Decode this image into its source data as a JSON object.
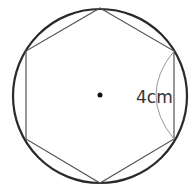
{
  "diagram": {
    "type": "regular hexagon inscribed in circle",
    "circle": {
      "cx": 100,
      "cy": 96,
      "r": 87,
      "stroke": "#2a2a2a",
      "stroke_width": 2.2
    },
    "hexagon": {
      "points": [
        [
          100,
          8
        ],
        [
          174,
          51
        ],
        [
          174,
          139
        ],
        [
          100,
          183
        ],
        [
          26,
          139
        ],
        [
          26,
          51
        ]
      ],
      "stroke": "#555555",
      "stroke_width": 1.2
    },
    "center_dot": {
      "cx": 100,
      "cy": 95,
      "r": 2.5,
      "fill": "#111111"
    },
    "arc": {
      "from": [
        174,
        51
      ],
      "to": [
        174,
        139
      ],
      "control": [
        138,
        95
      ],
      "stroke": "#999999",
      "stroke_width": 1
    },
    "label": {
      "text": "4cm",
      "x": 136,
      "y": 103
    }
  }
}
